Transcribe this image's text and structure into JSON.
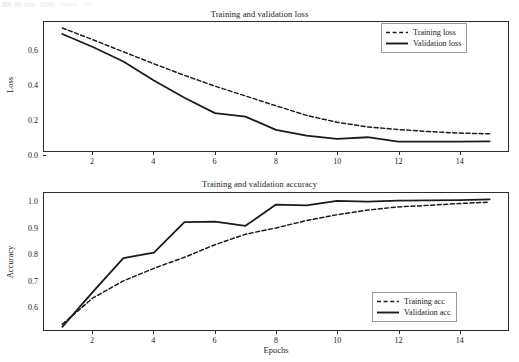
{
  "figure": {
    "width": 519,
    "height": 362,
    "background": "#ffffff",
    "line_color": "#1b1b1b"
  },
  "chart_data": [
    {
      "type": "line",
      "id": "loss-chart",
      "title": "Training and validation loss",
      "xlabel": "",
      "ylabel": "Loss",
      "xlim": [
        0.4,
        15.6
      ],
      "ylim": [
        -0.015,
        0.735
      ],
      "grid": false,
      "legend_position": "upper right",
      "xticks": [
        2,
        4,
        6,
        8,
        10,
        12,
        14
      ],
      "xtick_labels": [
        "2",
        "4",
        "6",
        "8",
        "10",
        "12",
        "14"
      ],
      "yticks": [
        0.0,
        0.2,
        0.4,
        0.6
      ],
      "ytick_labels": [
        "0.0",
        "0.2",
        "0.4",
        "0.6"
      ],
      "x": [
        1,
        2,
        3,
        4,
        5,
        6,
        7,
        8,
        9,
        10,
        11,
        12,
        13,
        14,
        15
      ],
      "series": [
        {
          "name": "Training loss",
          "style": "dashed",
          "color": "#1b1b1b",
          "values": [
            0.7,
            0.632,
            0.562,
            0.492,
            0.425,
            0.362,
            0.305,
            0.248,
            0.192,
            0.152,
            0.125,
            0.11,
            0.098,
            0.089,
            0.085
          ]
        },
        {
          "name": "Validation loss",
          "style": "solid",
          "color": "#1b1b1b",
          "values": [
            0.665,
            0.59,
            0.505,
            0.395,
            0.295,
            0.205,
            0.185,
            0.108,
            0.075,
            0.055,
            0.065,
            0.04,
            0.04,
            0.04,
            0.041
          ]
        }
      ]
    },
    {
      "type": "line",
      "id": "accuracy-chart",
      "title": "Training and validation accuracy",
      "xlabel": "Epochs",
      "ylabel": "Accuracy",
      "xlim": [
        0.4,
        15.6
      ],
      "ylim": [
        0.523,
        1.045
      ],
      "grid": false,
      "legend_position": "lower right",
      "xticks": [
        2,
        4,
        6,
        8,
        10,
        12,
        14
      ],
      "xtick_labels": [
        "2",
        "4",
        "6",
        "8",
        "10",
        "12",
        "14"
      ],
      "yticks": [
        0.6,
        0.7,
        0.8,
        0.9,
        1.0
      ],
      "ytick_labels": [
        "0.6",
        "0.7",
        "0.8",
        "0.9",
        "1.0"
      ],
      "x": [
        1,
        2,
        3,
        4,
        5,
        6,
        7,
        8,
        9,
        10,
        11,
        12,
        13,
        14,
        15
      ],
      "series": [
        {
          "name": "Training acc",
          "style": "dashed",
          "color": "#1b1b1b",
          "values": [
            0.545,
            0.645,
            0.71,
            0.758,
            0.8,
            0.848,
            0.888,
            0.912,
            0.94,
            0.962,
            0.98,
            0.992,
            0.998,
            1.005,
            1.01
          ]
        },
        {
          "name": "Validation acc",
          "style": "solid",
          "color": "#1b1b1b",
          "values": [
            0.535,
            0.668,
            0.797,
            0.818,
            0.934,
            0.936,
            0.92,
            1.001,
            0.998,
            1.015,
            1.012,
            1.016,
            1.017,
            1.018,
            1.021
          ]
        }
      ]
    }
  ],
  "panels": {
    "loss": {
      "title": "Training and validation loss",
      "ylabel": "Loss",
      "ytick_labels": [
        "0.6",
        "0.4",
        "0.2",
        "0.0"
      ],
      "xtick_labels": [
        "2",
        "4",
        "6",
        "8",
        "10",
        "12",
        "14"
      ],
      "legend": [
        {
          "label": "Training loss",
          "style": "dashed"
        },
        {
          "label": "Validation loss",
          "style": "solid"
        }
      ]
    },
    "accuracy": {
      "title": "Training and validation accuracy",
      "ylabel": "Accuracy",
      "xlabel": "Epochs",
      "ytick_labels": [
        "1.0",
        "0.9",
        "0.8",
        "0.7",
        "0.6"
      ],
      "xtick_labels": [
        "2",
        "4",
        "6",
        "8",
        "10",
        "12",
        "14"
      ],
      "legend": [
        {
          "label": "Training acc",
          "style": "dashed"
        },
        {
          "label": "Validation acc",
          "style": "solid"
        }
      ]
    }
  }
}
